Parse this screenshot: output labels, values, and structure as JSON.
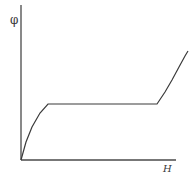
{
  "chart_data": {
    "type": "line",
    "title": "",
    "xlabel": "H",
    "ylabel": "φ",
    "grid": false,
    "legend": null,
    "axes": {
      "origin_px": [
        21,
        160
      ],
      "x_axis_end_px": [
        176,
        160
      ],
      "y_axis_top_px": [
        21,
        5
      ]
    },
    "series": [
      {
        "name": "φ vs H",
        "description": "Rises concavely from origin, flat plateau, then rises again steeply",
        "points_px": [
          [
            21,
            160
          ],
          [
            26,
            142
          ],
          [
            32,
            127
          ],
          [
            40,
            113
          ],
          [
            48,
            104
          ],
          [
            157,
            104
          ],
          [
            165,
            92
          ],
          [
            172,
            80
          ],
          [
            179,
            67
          ],
          [
            185,
            56
          ],
          [
            188,
            51
          ]
        ]
      }
    ],
    "ticks": {
      "x": [],
      "y": []
    }
  },
  "labels": {
    "y_axis": "φ",
    "x_axis": "H"
  },
  "colors": {
    "line": "#3a3a3a",
    "axis": "#4a4a4a",
    "background": "#ffffff"
  }
}
